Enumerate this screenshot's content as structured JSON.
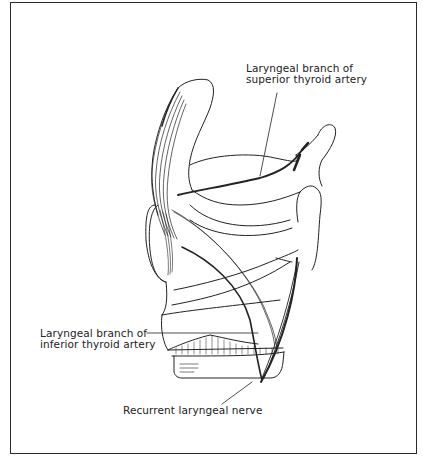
{
  "figure": {
    "labels": {
      "superior_artery": {
        "line1": "Laryngeal branch of",
        "line2": "superior thyroid artery"
      },
      "inferior_artery": {
        "line1": "Laryngeal branch of",
        "line2": "inferior thyroid artery"
      },
      "nerve": {
        "text": "Recurrent laryngeal nerve"
      }
    }
  },
  "colors": {
    "ink": "#222222",
    "background": "#ffffff",
    "frame": "#2a2a2a"
  }
}
